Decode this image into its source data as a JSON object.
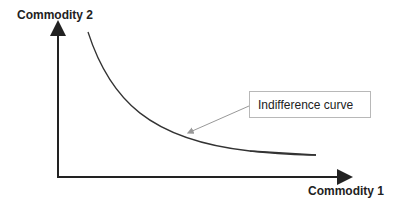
{
  "diagram": {
    "y_axis_label": "Commodity 2",
    "x_axis_label": "Commodity 1",
    "callout_label": "Indifference curve",
    "colors": {
      "axis": "#222222",
      "curve": "#333333",
      "callout_border": "#b8b8b8",
      "callout_arrow": "#999999"
    }
  }
}
